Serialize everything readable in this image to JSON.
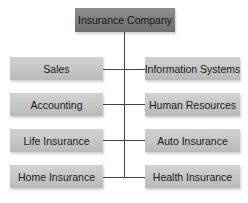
{
  "chart": {
    "root": "Insurance Company",
    "left": [
      "Sales",
      "Accounting",
      "Life Insurance",
      "Home Insurance"
    ],
    "right": [
      "Information Systems",
      "Human Resources",
      "Auto Insurance",
      "Health Insurance"
    ]
  },
  "colors": {
    "root_fill": "#7e7e7e",
    "child_fill": "#c5c5c5",
    "line": "#444444"
  }
}
